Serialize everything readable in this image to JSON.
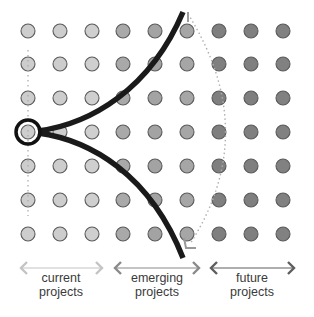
{
  "diagram": {
    "grid": {
      "columns_x": [
        28,
        60,
        92,
        123,
        155,
        187,
        219,
        251,
        283
      ],
      "rows_y": [
        31,
        64,
        98,
        132,
        166,
        200,
        234
      ],
      "dot_radius": 7,
      "column_fill_colors": [
        "#cdcdcd",
        "#cdcdcd",
        "#cfcfcf",
        "#a9a9a9",
        "#a3a3a3",
        "#a6a6a6",
        "#7f7f7f",
        "#7f7f7f",
        "#818181"
      ],
      "dot_stroke": "#5a5a5a"
    },
    "origin": {
      "x": 28,
      "y": 132,
      "ring_radius": 12,
      "label": "current project origin"
    },
    "colors": {
      "curve": "#1a1a1a",
      "dotted_line": "#b0b0b0",
      "arrow_current": "#bdbdbd",
      "arrow_emerging": "#8a8a8a",
      "arrow_future": "#5e5e5e"
    }
  },
  "categories": [
    {
      "line1": "current",
      "line2": "projects",
      "x_start": 20,
      "x_end": 103,
      "center": 61
    },
    {
      "line1": "emerging",
      "line2": "projects",
      "x_start": 114,
      "x_end": 200,
      "center": 157
    },
    {
      "line1": "future",
      "line2": "projects",
      "x_start": 210,
      "x_end": 295,
      "center": 252
    }
  ]
}
